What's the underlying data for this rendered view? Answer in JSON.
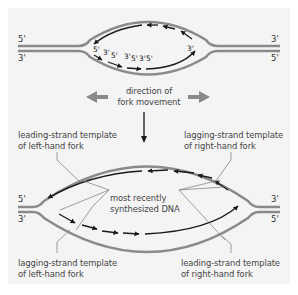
{
  "colors": {
    "panel_background": "#f4f4f4",
    "template_strand": "#8a8a8a",
    "new_strand": "#1a1a1a",
    "fork_arrow": "#8a8a8a",
    "leader_line": "#777777",
    "label_text": "#444444"
  },
  "top_bubble": {
    "left_ends": {
      "top": "5'",
      "bottom": "3'"
    },
    "right_ends": {
      "top": "3'",
      "bottom": "5'"
    },
    "okazaki_labels": [
      "5'",
      "3'",
      "5'",
      "3'",
      "5'",
      "3'",
      "5'"
    ],
    "leading_end_label": "3'"
  },
  "fork_direction": {
    "label_line1": "direction of",
    "label_line2": "fork movement",
    "left_arrow": "left-arrow",
    "right_arrow": "right-arrow",
    "down_arrow": "down-arrow"
  },
  "labels": {
    "top_left_line1": "leading-strand template",
    "top_left_line2": "of left-hand fork",
    "top_right_line1": "lagging-strand template",
    "top_right_line2": "of right-hand fork",
    "center_line1": "most recently",
    "center_line2": "synthesized DNA",
    "bottom_left_line1": "lagging-strand template",
    "bottom_left_line2": "of left-hand fork",
    "bottom_right_line1": "leading-strand template",
    "bottom_right_line2": "of right-hand fork"
  },
  "bottom_bubble": {
    "left_ends": {
      "top": "5'",
      "bottom": "3'"
    },
    "right_ends": {
      "top": "3'",
      "bottom": "5'"
    }
  }
}
